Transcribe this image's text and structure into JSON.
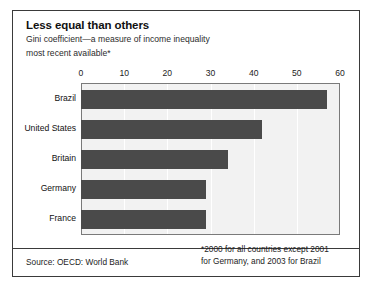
{
  "header": {
    "title": "Less equal than others",
    "subtitle_line1": "Gini coefficient—a measure of income inequality",
    "subtitle_line2": "most recent available*"
  },
  "footer": {
    "source": "Source: OECD: World Bank",
    "footnote_line1": "*2000 for all countries except 2001",
    "footnote_line2": "for Germany, and 2003 for Brazil"
  },
  "style": {
    "bar_color": "#4a4a4a",
    "plot_background": "#f2f2f2",
    "gridline_color": "#ffffff",
    "border_color": "#3a3a3a"
  },
  "chart_data": {
    "type": "bar",
    "orientation": "horizontal",
    "title": "Less equal than others",
    "subtitle": "Gini coefficient—a measure of income inequality, most recent available*",
    "categories": [
      "Brazil",
      "United States",
      "Britain",
      "Germany",
      "France"
    ],
    "values": [
      57,
      42,
      34,
      29,
      29
    ],
    "series": [
      {
        "name": "Gini coefficient",
        "values": [
          57,
          42,
          34,
          29,
          29
        ]
      }
    ],
    "xlabel": "",
    "ylabel": "",
    "xlim": [
      0,
      60
    ],
    "xticks": [
      0,
      10,
      20,
      30,
      40,
      50,
      60
    ],
    "xtick_labels": [
      "0",
      "10",
      "20",
      "30",
      "40",
      "50",
      "60"
    ],
    "grid": true,
    "legend": false
  }
}
